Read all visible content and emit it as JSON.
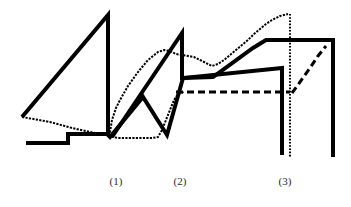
{
  "figure": {
    "background_color": "#ffffff",
    "ink_color": "#000000",
    "width": 351,
    "height": 207
  },
  "annotations": [
    {
      "label": "(1)",
      "x": 116
    },
    {
      "label": "(2)",
      "x": 180
    },
    {
      "label": "(3)",
      "x": 285
    }
  ],
  "chart_data": {
    "type": "line",
    "title": "",
    "subtitle": "",
    "xlabel": "",
    "ylabel": "",
    "grid": false,
    "legend_position": "none",
    "axis_visible": false,
    "xlim": [
      0,
      351
    ],
    "ylim": [
      0,
      207
    ],
    "y_axis_inverted": true,
    "annotations": [
      "(1)",
      "(2)",
      "(3)"
    ],
    "annotation_x": [
      116,
      180,
      285
    ],
    "series": [
      {
        "name": "thick-solid-trace",
        "style": "solid",
        "width": 4,
        "color": "#000000",
        "points": [
          [
            22,
            117
          ],
          [
            108,
            15
          ],
          [
            108,
            135
          ],
          [
            110,
            137
          ],
          [
            143,
            97
          ],
          [
            167,
            135
          ],
          [
            183,
            78
          ],
          [
            282,
            68
          ],
          [
            282,
            155
          ]
        ]
      },
      {
        "name": "thick-solid-ramp-trace",
        "style": "solid",
        "width": 4,
        "color": "#000000",
        "points": [
          [
            112,
            137
          ],
          [
            182,
            33
          ],
          [
            182,
            78
          ],
          [
            183,
            78
          ],
          [
            213,
            77
          ],
          [
            253,
            48
          ],
          [
            266,
            40
          ],
          [
            333,
            40
          ],
          [
            333,
            157
          ]
        ]
      },
      {
        "name": "baseline-step-trace",
        "style": "solid",
        "width": 4,
        "color": "#000000",
        "points": [
          [
            26,
            143
          ],
          [
            68,
            143
          ],
          [
            68,
            134
          ],
          [
            108,
            134
          ]
        ]
      },
      {
        "name": "stippled-trace",
        "style": "stippled",
        "width": 2,
        "color": "#000000",
        "points": [
          [
            22,
            117
          ],
          [
            50,
            122
          ],
          [
            72,
            128
          ],
          [
            95,
            133
          ],
          [
            108,
            135
          ],
          [
            110,
            132
          ],
          [
            112,
            120
          ],
          [
            116,
            108
          ],
          [
            120,
            100
          ],
          [
            124,
            93
          ],
          [
            128,
            86
          ],
          [
            133,
            79
          ],
          [
            138,
            72
          ],
          [
            143,
            66
          ],
          [
            148,
            60
          ],
          [
            153,
            56
          ],
          [
            158,
            52
          ],
          [
            164,
            50
          ],
          [
            170,
            51
          ],
          [
            176,
            54
          ],
          [
            182,
            55
          ],
          [
            188,
            56
          ],
          [
            194,
            57
          ],
          [
            200,
            60
          ],
          [
            206,
            63
          ],
          [
            212,
            66
          ],
          [
            218,
            64
          ],
          [
            224,
            60
          ],
          [
            230,
            55
          ],
          [
            236,
            50
          ],
          [
            242,
            45
          ],
          [
            248,
            40
          ],
          [
            254,
            34
          ],
          [
            260,
            29
          ],
          [
            266,
            24
          ],
          [
            272,
            20
          ],
          [
            280,
            16
          ],
          [
            288,
            14
          ]
        ]
      },
      {
        "name": "stippled-valley-trace",
        "style": "stippled",
        "width": 2,
        "color": "#000000",
        "points": [
          [
            108,
            136
          ],
          [
            118,
            138
          ],
          [
            130,
            138
          ],
          [
            142,
            138
          ],
          [
            152,
            138
          ],
          [
            158,
            137
          ],
          [
            162,
            130
          ],
          [
            166,
            120
          ],
          [
            170,
            110
          ],
          [
            174,
            100
          ],
          [
            178,
            94
          ],
          [
            184,
            92
          ]
        ]
      },
      {
        "name": "dashed-horizontal-trace",
        "style": "dashed",
        "width": 3,
        "color": "#000000",
        "points": [
          [
            176,
            92
          ],
          [
            290,
            92
          ]
        ]
      },
      {
        "name": "dashed-diagonal-trace",
        "style": "dashed",
        "width": 3,
        "color": "#000000",
        "points": [
          [
            292,
            93
          ],
          [
            300,
            82
          ],
          [
            310,
            68
          ],
          [
            318,
            56
          ],
          [
            326,
            46
          ]
        ]
      },
      {
        "name": "vertical-dotted-marker",
        "style": "dotted",
        "width": 2,
        "color": "#000000",
        "points": [
          [
            290,
            14
          ],
          [
            290,
            157
          ]
        ]
      }
    ]
  }
}
